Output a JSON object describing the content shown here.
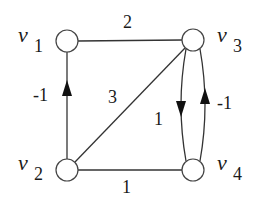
{
  "diagram": {
    "type": "directed weighted graph",
    "colors": {
      "stroke": "#333333",
      "node_fill": "#ffffff",
      "text": "#1a1a1a"
    },
    "nodes": [
      {
        "id": "v1",
        "name": "v",
        "subscript": "1",
        "x": 67,
        "y": 41
      },
      {
        "id": "v2",
        "name": "v",
        "subscript": "2",
        "x": 67,
        "y": 170
      },
      {
        "id": "v3",
        "name": "v",
        "subscript": "3",
        "x": 193,
        "y": 40
      },
      {
        "id": "v4",
        "name": "v",
        "subscript": "4",
        "x": 193,
        "y": 170
      }
    ],
    "edges": [
      {
        "from": "v1",
        "to": "v3",
        "weight": "2",
        "directed": false
      },
      {
        "from": "v2",
        "to": "v1",
        "weight": "-1",
        "directed": true
      },
      {
        "from": "v2",
        "to": "v3",
        "weight": "3",
        "directed": false
      },
      {
        "from": "v2",
        "to": "v4",
        "weight": "1",
        "directed": false
      },
      {
        "from": "v3",
        "to": "v4",
        "weight": "1",
        "directed": true
      },
      {
        "from": "v4",
        "to": "v3",
        "weight": "-1",
        "directed": true
      }
    ]
  }
}
